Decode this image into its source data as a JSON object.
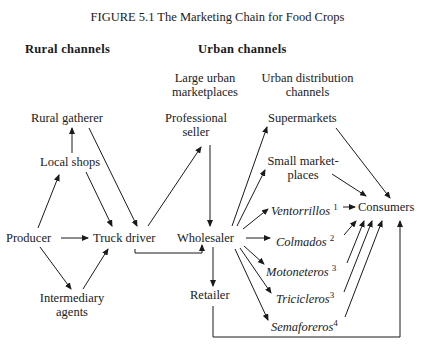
{
  "title": "FIGURE 5.1    The Marketing Chain for Food Crops",
  "headers": {
    "rural": "Rural  channels",
    "urban": "Urban  channels",
    "large_marketplaces": [
      "Large urban",
      "marketplaces"
    ],
    "distribution": [
      "Urban distribution",
      "channels"
    ]
  },
  "nodes": {
    "rural_gatherer": "Rural gatherer",
    "local_shops": "Local shops",
    "producer": "Producer",
    "truck_driver": "Truck driver",
    "intermediary": [
      "Intermediary",
      "agents"
    ],
    "professional_seller": [
      "Professional",
      "seller"
    ],
    "wholesaler": "Wholesaler",
    "retailer": "Retailer",
    "supermarkets": "Supermarkets",
    "small_marketplaces": [
      "Small market-",
      "places"
    ],
    "ventorrillos": "Ventorrillos",
    "ventorrillos_note": "1",
    "colmados": "Colmados",
    "colmados_note": "2",
    "motoneteros": "Motoneteros",
    "motoneteros_note": "3",
    "tricicleros": "Tricicleros",
    "tricicleros_note": "3",
    "semaforeros": "Semaforeros",
    "semaforeros_note": "4",
    "consumers": "Consumers"
  },
  "edges": [
    [
      "producer",
      "local_shops"
    ],
    [
      "local_shops",
      "rural_gatherer"
    ],
    [
      "producer",
      "truck_driver"
    ],
    [
      "producer",
      "intermediary"
    ],
    [
      "intermediary",
      "truck_driver"
    ],
    [
      "local_shops",
      "truck_driver"
    ],
    [
      "rural_gatherer",
      "truck_driver"
    ],
    [
      "truck_driver",
      "professional_seller"
    ],
    [
      "truck_driver",
      "wholesaler"
    ],
    [
      "professional_seller",
      "wholesaler"
    ],
    [
      "wholesaler",
      "supermarkets"
    ],
    [
      "wholesaler",
      "small_marketplaces"
    ],
    [
      "wholesaler",
      "ventorrillos"
    ],
    [
      "wholesaler",
      "colmados"
    ],
    [
      "wholesaler",
      "motoneteros"
    ],
    [
      "wholesaler",
      "tricicleros"
    ],
    [
      "wholesaler",
      "semaforeros"
    ],
    [
      "wholesaler",
      "retailer"
    ],
    [
      "supermarkets",
      "consumers"
    ],
    [
      "small_marketplaces",
      "consumers"
    ],
    [
      "ventorrillos",
      "consumers"
    ],
    [
      "colmados",
      "consumers"
    ],
    [
      "motoneteros",
      "consumers"
    ],
    [
      "tricicleros",
      "consumers"
    ],
    [
      "semaforeros",
      "consumers"
    ],
    [
      "retailer",
      "consumers"
    ]
  ]
}
